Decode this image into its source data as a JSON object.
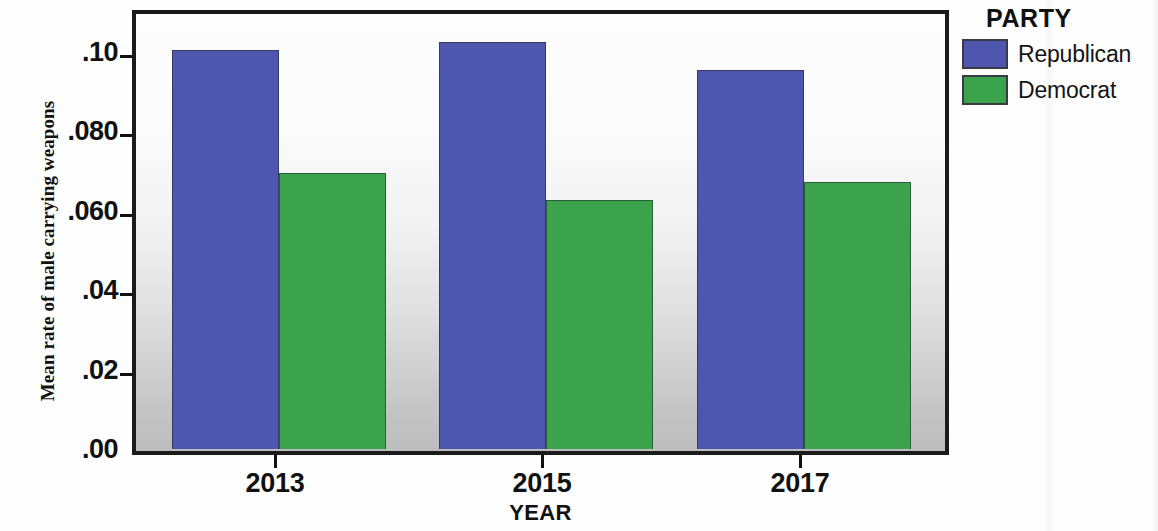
{
  "chart_data": {
    "type": "bar",
    "title": "",
    "xlabel": "YEAR",
    "ylabel": "Mean rate of male carrying weapons",
    "categories": [
      "2013",
      "2015",
      "2017"
    ],
    "series": [
      {
        "name": "Republican",
        "color": "#4f56ae",
        "values": [
          0.1005,
          0.1025,
          0.0955
        ]
      },
      {
        "name": "Democrat",
        "color": "#3aa34c",
        "values": [
          0.0695,
          0.0628,
          0.0673
        ]
      }
    ],
    "ylim": [
      0.0,
      0.1115
    ],
    "ytick_values": [
      0.1,
      0.08,
      0.06,
      0.04,
      0.02,
      0.0
    ],
    "ytick_labels": [
      ".10",
      ".080",
      ".060",
      ".04",
      ".02",
      ".00"
    ],
    "grid": false,
    "legend": {
      "title": "PARTY",
      "position": "right",
      "entries": [
        {
          "label": "Republican",
          "color": "#4f56ae"
        },
        {
          "label": "Democrat",
          "color": "#3aa34c"
        }
      ]
    },
    "plot_background": "vertical-gradient-white-to-grey"
  },
  "axes": {
    "y_title": "Mean rate of male carrying weapons",
    "x_title": "YEAR"
  },
  "legend": {
    "title": "PARTY",
    "republican_label": "Republican",
    "democrat_label": "Democrat"
  },
  "colors": {
    "republican": "#4f56ae",
    "democrat": "#3aa34c",
    "axis": "#111111"
  }
}
